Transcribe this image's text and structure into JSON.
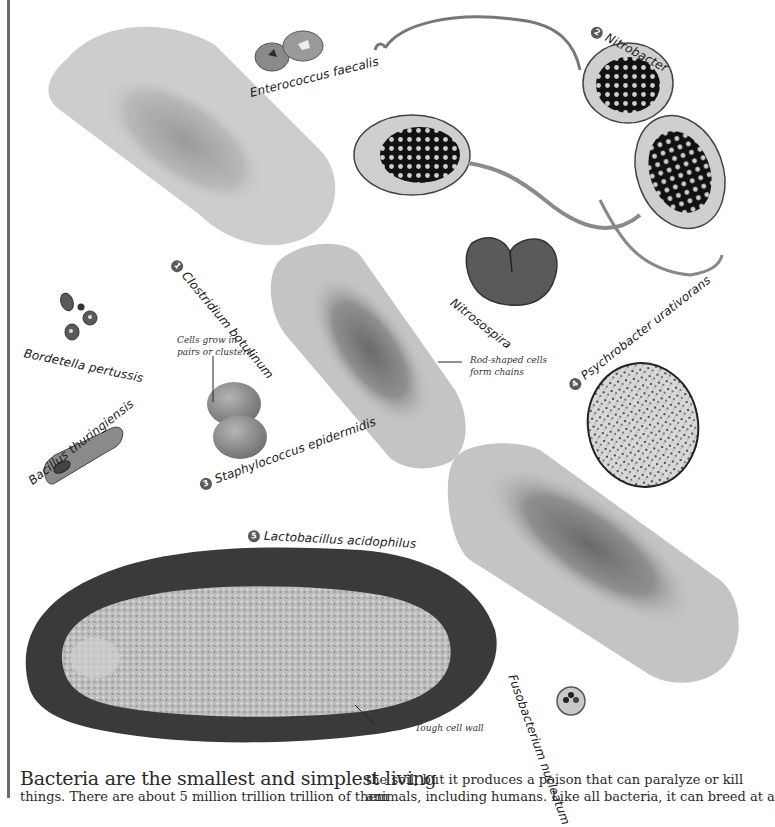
{
  "labels": {
    "enterococcus": "Enterococcus faecalis",
    "nitrobacter": {
      "number": "2",
      "name": "Nitrobacter"
    },
    "clostridium": {
      "number": "1",
      "name": "Clostridium botulinum"
    },
    "nitrosospira": "Nitrosospira",
    "bordetella": "Bordetella pertussis",
    "psychrobacter": {
      "number": "4",
      "name": "Psychrobacter urativorans"
    },
    "staphylococcus": {
      "number": "3",
      "name": "Staphylococcus epidermidis"
    },
    "bacillus": "Bacillus thuringiensis",
    "lactobacillus": {
      "number": "5",
      "name": "Lactobacillus acidophilus"
    },
    "fusobacterium": "Fusobacterium nucleatum"
  },
  "captions": {
    "cells_grow_line1": "Cells grow in",
    "cells_grow_line2": "pairs or clusters",
    "rod_shaped_line1": "Rod-shaped cells",
    "rod_shaped_line2": "form chains",
    "tough_wall": "Tough cell wall"
  },
  "body_text": {
    "left_lead": "Bacteria are the smallest and simplest living",
    "left_line2": "things. There are about 5 million trillion trillion of them",
    "right_line1": "the soil, but it produces a poison that can paralyze or kill",
    "right_line2": "animals, including humans. Like all bacteria, it can breed at a"
  },
  "colors": {
    "rule": "#6b6b6b",
    "badge": "#5a5a5a",
    "rod_fill": "#c4c4c4",
    "rod_core": "#6e6e6e",
    "cell_wall_dark": "#3a3a3a"
  }
}
